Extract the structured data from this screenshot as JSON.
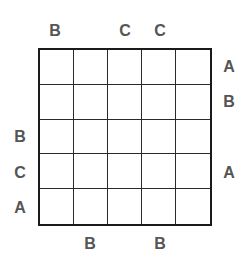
{
  "puzzle": {
    "type": "Easy as ABC",
    "size": 5,
    "letters": [
      "A",
      "B",
      "C"
    ],
    "clues": {
      "top": [
        "B",
        "",
        "C",
        "C",
        ""
      ],
      "bottom": [
        "",
        "B",
        "",
        "B",
        ""
      ],
      "left": [
        "",
        "",
        "B",
        "C",
        "A"
      ],
      "right": [
        "A",
        "B",
        "",
        "A",
        ""
      ]
    },
    "cells": [
      [
        "",
        "",
        "",
        "",
        ""
      ],
      [
        "",
        "",
        "",
        "",
        ""
      ],
      [
        "",
        "",
        "",
        "",
        ""
      ],
      [
        "",
        "",
        "",
        "",
        ""
      ],
      [
        "",
        "",
        "",
        "",
        ""
      ]
    ]
  },
  "colors": {
    "clue_text": "#555555",
    "grid_line": "#1a1a1a",
    "background": "#ffffff"
  }
}
